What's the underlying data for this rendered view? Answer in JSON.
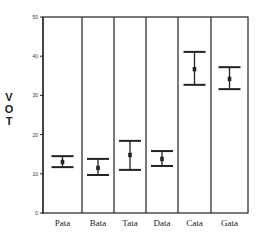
{
  "chart_data": {
    "type": "errorbar",
    "title": "",
    "xlabel": "",
    "ylabel": "VOT",
    "ylim": [
      0,
      50
    ],
    "yticks": [
      0,
      10,
      20,
      30,
      40,
      50
    ],
    "grid": false,
    "legend": null,
    "categories": [
      "Pata",
      "Bata",
      "Tata",
      "Data",
      "Cata",
      "Gata"
    ],
    "series": [
      {
        "name": "VOT",
        "mean": [
          13.0,
          11.5,
          14.8,
          13.8,
          36.7,
          34.2
        ],
        "upper": [
          14.5,
          13.8,
          18.4,
          15.8,
          41.1,
          37.2
        ],
        "lower": [
          11.7,
          9.7,
          11.0,
          12.0,
          32.7,
          31.6
        ]
      }
    ]
  },
  "axis": {
    "ylabel_letters": [
      "V",
      "O",
      "T"
    ],
    "ytick_labels": [
      "0",
      "10",
      "20",
      "30",
      "40",
      "50"
    ]
  },
  "colors": {
    "line": "#222222",
    "background": "#ffffff"
  }
}
